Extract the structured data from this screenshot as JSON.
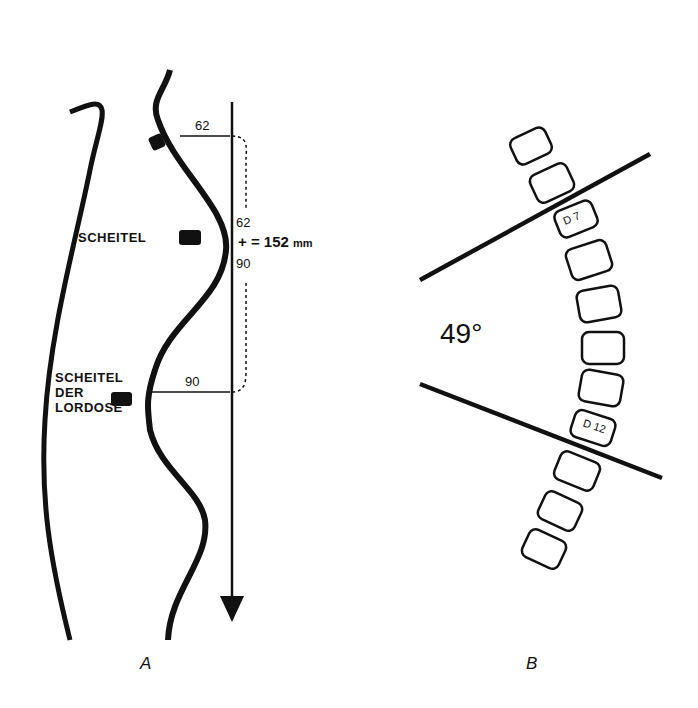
{
  "panel_a": {
    "label_scheitel": "SCHEITEL",
    "label_lordose_1": "SCHEITEL",
    "label_lordose_2": "DER",
    "label_lordose_3": "LORDOSE",
    "dist_top": "62",
    "sum_top": "62",
    "sum_op": "+ = 152",
    "sum_unit": "mm",
    "sum_bottom": "90",
    "dist_bottom": "90",
    "caption": "A"
  },
  "panel_b": {
    "angle": "49°",
    "vertebra_top": "D 7",
    "vertebra_bottom": "D 12",
    "caption": "B"
  }
}
